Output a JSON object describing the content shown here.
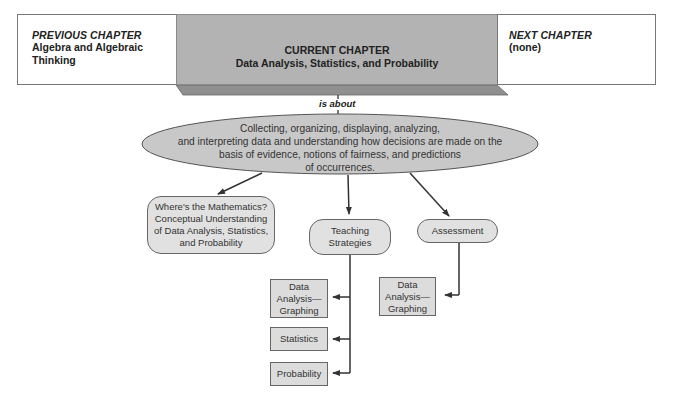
{
  "header": {
    "previous": {
      "label": "PREVIOUS CHAPTER",
      "title_line1": "Algebra and Algebraic",
      "title_line2": "Thinking"
    },
    "current": {
      "label": "CURRENT CHAPTER",
      "title": "Data Analysis, Statistics, and Probability"
    },
    "next": {
      "label": "NEXT CHAPTER",
      "title": "(none)"
    }
  },
  "link_label": "is about",
  "central_idea": {
    "line1": "Collecting, organizing, displaying, analyzing,",
    "line2": "and interpreting data and understanding how decisions are made on the",
    "line3": "basis of evidence, notions of fairness, and predictions",
    "line4": "of occurrences."
  },
  "branches": {
    "mathematics": {
      "line1": "Where's the Mathematics?",
      "line2": "Conceptual Understanding",
      "line3": "of Data Analysis, Statistics,",
      "line4": "and Probability"
    },
    "teaching": {
      "line1": "Teaching",
      "line2": "Strategies"
    },
    "assessment": {
      "label": "Assessment"
    }
  },
  "teaching_items": [
    {
      "line1": "Data",
      "line2": "Analysis—",
      "line3": "Graphing"
    },
    {
      "line1": "Statistics"
    },
    {
      "line1": "Probability"
    }
  ],
  "assessment_items": [
    {
      "line1": "Data",
      "line2": "Analysis—",
      "line3": "Graphing"
    }
  ],
  "colors": {
    "current_fill": "#b3b3b3",
    "node_fill": "#e1e1e1",
    "ellipse_fill": "#c8c8c8",
    "line": "#333333"
  }
}
